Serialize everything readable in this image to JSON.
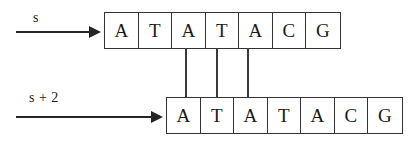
{
  "diagram": {
    "colors": {
      "ink": "#1a1a1a",
      "line": "#333333",
      "arrow": "#262626",
      "background": "#ffffff"
    },
    "arrows": [
      {
        "label": "s",
        "name": "arrow-s"
      },
      {
        "label": "s + 2",
        "name": "arrow-s-plus-2"
      }
    ],
    "strips": [
      {
        "name": "top-strip",
        "label": "s",
        "cells": [
          "A",
          "T",
          "A",
          "T",
          "A",
          "C",
          "G"
        ]
      },
      {
        "name": "bottom-strip",
        "label": "s + 2",
        "cells": [
          "A",
          "T",
          "A",
          "T",
          "A",
          "C",
          "G"
        ]
      }
    ],
    "connectors": [
      {
        "name": "connector-1",
        "x": 185,
        "top_cell_index": 2,
        "bottom_cell_index": 0
      },
      {
        "name": "connector-2",
        "x": 216,
        "top_cell_index": 3,
        "bottom_cell_index": 1
      },
      {
        "name": "connector-3",
        "x": 247,
        "top_cell_index": 4,
        "bottom_cell_index": 2
      }
    ]
  }
}
